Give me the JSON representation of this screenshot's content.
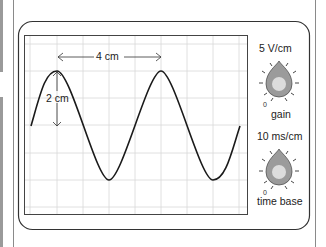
{
  "diagram": {
    "screen": {
      "grid_cm": {
        "columns": 8.5,
        "rows": 6.5
      },
      "wavelength_label": "4 cm",
      "amplitude_label": "2 cm"
    },
    "controls": [
      {
        "name": "gain",
        "setting": "5 V/cm",
        "label": "gain",
        "zero_mark": "0"
      },
      {
        "name": "time-base",
        "setting": "10 ms/cm",
        "label": "time base",
        "zero_mark": "0"
      }
    ],
    "colors": {
      "trace": "#1a1a1a",
      "grid": "#d8d8d8",
      "knob_outer": "#9b9b9b",
      "knob_inner": "#dcdcdc",
      "frame": "#333333"
    }
  }
}
